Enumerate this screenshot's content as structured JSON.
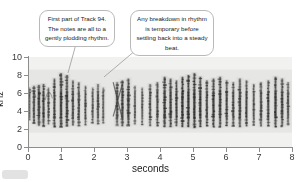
{
  "figure": {
    "background_color": "#ffffff",
    "plot_background_color": "#f1f1ef",
    "axis_color": "#8d8d8d"
  },
  "axes": {
    "x_title": "seconds",
    "y_title": "kHz",
    "x_ticks": [
      "0",
      "1",
      "2",
      "3",
      "4",
      "5",
      "6",
      "7",
      "8"
    ],
    "y_ticks": [
      "10",
      "8",
      "6",
      "4",
      "2",
      "0"
    ]
  },
  "callouts": [
    {
      "id": "callout-track",
      "text": "First part of Track 94. The notes are all to a gently plodding rhythm."
    },
    {
      "id": "callout-rhythm",
      "text": "Any breakdown in rhythm is temporary before settling back into a steady beat."
    }
  ],
  "chart_data": {
    "type": "heatmap",
    "title": "",
    "xlabel": "seconds",
    "ylabel": "kHz",
    "xlim": [
      0,
      8
    ],
    "ylim": [
      0,
      10
    ],
    "grid": false,
    "legend": "none",
    "colormap": "grayscale",
    "intensity_range": [
      0,
      1
    ],
    "notes": [
      {
        "time": 0.05,
        "freq_low": 3.0,
        "freq_high": 6.6,
        "intensity": 0.55,
        "width": 0.07
      },
      {
        "time": 0.18,
        "freq_low": 2.6,
        "freq_high": 6.8,
        "intensity": 0.72,
        "width": 0.09
      },
      {
        "time": 0.33,
        "freq_low": 2.4,
        "freq_high": 6.9,
        "intensity": 0.85,
        "width": 0.1
      },
      {
        "time": 0.47,
        "freq_low": 2.3,
        "freq_high": 7.0,
        "intensity": 0.8,
        "width": 0.09
      },
      {
        "time": 0.62,
        "freq_low": 2.5,
        "freq_high": 6.6,
        "intensity": 0.62,
        "width": 0.08
      },
      {
        "time": 0.8,
        "freq_low": 2.2,
        "freq_high": 7.6,
        "intensity": 0.78,
        "width": 0.09
      },
      {
        "time": 1.0,
        "freq_low": 2.2,
        "freq_high": 8.2,
        "intensity": 0.88,
        "width": 0.1
      },
      {
        "time": 1.18,
        "freq_low": 2.3,
        "freq_high": 8.0,
        "intensity": 0.82,
        "width": 0.1
      },
      {
        "time": 1.36,
        "freq_low": 2.4,
        "freq_high": 7.4,
        "intensity": 0.74,
        "width": 0.09
      },
      {
        "time": 1.54,
        "freq_low": 2.3,
        "freq_high": 7.2,
        "intensity": 0.7,
        "width": 0.09
      },
      {
        "time": 1.74,
        "freq_low": 2.4,
        "freq_high": 6.8,
        "intensity": 0.66,
        "width": 0.08
      },
      {
        "time": 1.96,
        "freq_low": 2.6,
        "freq_high": 6.6,
        "intensity": 0.6,
        "width": 0.08
      },
      {
        "time": 2.12,
        "freq_low": 2.5,
        "freq_high": 7.0,
        "intensity": 0.68,
        "width": 0.09
      },
      {
        "time": 2.28,
        "freq_low": 2.6,
        "freq_high": 6.6,
        "intensity": 0.58,
        "width": 0.08
      },
      {
        "time": 2.7,
        "freq_low": 2.4,
        "freq_high": 7.2,
        "intensity": 0.7,
        "width": 0.1
      },
      {
        "time": 2.86,
        "freq_low": 2.3,
        "freq_high": 7.4,
        "intensity": 0.76,
        "width": 0.1
      },
      {
        "time": 3.04,
        "freq_low": 2.4,
        "freq_high": 7.6,
        "intensity": 0.8,
        "width": 0.1
      },
      {
        "time": 3.24,
        "freq_low": 2.5,
        "freq_high": 6.8,
        "intensity": 0.62,
        "width": 0.08
      },
      {
        "time": 3.46,
        "freq_low": 2.4,
        "freq_high": 6.6,
        "intensity": 0.58,
        "width": 0.08
      },
      {
        "time": 3.7,
        "freq_low": 2.3,
        "freq_high": 7.0,
        "intensity": 0.66,
        "width": 0.09
      },
      {
        "time": 3.92,
        "freq_low": 2.3,
        "freq_high": 7.2,
        "intensity": 0.72,
        "width": 0.09
      },
      {
        "time": 4.14,
        "freq_low": 2.2,
        "freq_high": 7.8,
        "intensity": 0.84,
        "width": 0.1
      },
      {
        "time": 4.32,
        "freq_low": 2.2,
        "freq_high": 7.6,
        "intensity": 0.82,
        "width": 0.1
      },
      {
        "time": 4.5,
        "freq_low": 2.3,
        "freq_high": 7.4,
        "intensity": 0.78,
        "width": 0.09
      },
      {
        "time": 4.68,
        "freq_low": 2.2,
        "freq_high": 7.8,
        "intensity": 0.86,
        "width": 0.1
      },
      {
        "time": 4.86,
        "freq_low": 2.2,
        "freq_high": 8.0,
        "intensity": 0.88,
        "width": 0.1
      },
      {
        "time": 5.04,
        "freq_low": 2.1,
        "freq_high": 8.2,
        "intensity": 0.9,
        "width": 0.1
      },
      {
        "time": 5.22,
        "freq_low": 2.2,
        "freq_high": 7.8,
        "intensity": 0.84,
        "width": 0.1
      },
      {
        "time": 5.42,
        "freq_low": 2.3,
        "freq_high": 7.4,
        "intensity": 0.78,
        "width": 0.09
      },
      {
        "time": 5.62,
        "freq_low": 2.2,
        "freq_high": 7.6,
        "intensity": 0.82,
        "width": 0.1
      },
      {
        "time": 5.82,
        "freq_low": 2.2,
        "freq_high": 7.8,
        "intensity": 0.84,
        "width": 0.1
      },
      {
        "time": 6.02,
        "freq_low": 2.3,
        "freq_high": 7.4,
        "intensity": 0.78,
        "width": 0.09
      },
      {
        "time": 6.22,
        "freq_low": 2.3,
        "freq_high": 7.2,
        "intensity": 0.74,
        "width": 0.09
      },
      {
        "time": 6.42,
        "freq_low": 2.2,
        "freq_high": 7.6,
        "intensity": 0.8,
        "width": 0.1
      },
      {
        "time": 6.62,
        "freq_low": 2.3,
        "freq_high": 7.4,
        "intensity": 0.76,
        "width": 0.09
      },
      {
        "time": 6.84,
        "freq_low": 2.4,
        "freq_high": 7.0,
        "intensity": 0.68,
        "width": 0.08
      },
      {
        "time": 7.06,
        "freq_low": 2.3,
        "freq_high": 7.2,
        "intensity": 0.72,
        "width": 0.09
      },
      {
        "time": 7.28,
        "freq_low": 2.3,
        "freq_high": 7.4,
        "intensity": 0.76,
        "width": 0.09
      },
      {
        "time": 7.5,
        "freq_low": 2.2,
        "freq_high": 7.8,
        "intensity": 0.82,
        "width": 0.1
      },
      {
        "time": 7.7,
        "freq_low": 2.3,
        "freq_high": 7.6,
        "intensity": 0.78,
        "width": 0.1
      },
      {
        "time": 7.88,
        "freq_low": 2.4,
        "freq_high": 7.2,
        "intensity": 0.7,
        "width": 0.09
      }
    ]
  }
}
